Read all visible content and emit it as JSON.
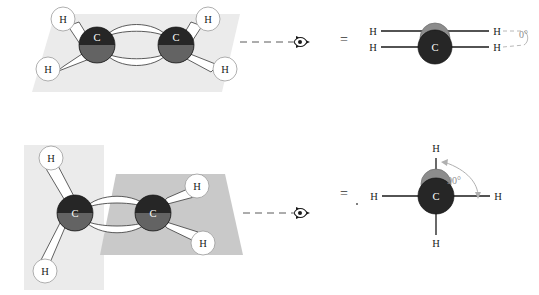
{
  "figure": {
    "colors": {
      "plane_light": "#ebebeb",
      "plane_medium": "#e2e2e2",
      "plane_dark": "#bfbfbf",
      "carbon_dark": "#262626",
      "carbon_shadow": "#6e6e6e",
      "back_atom_gray": "#8c8c8c",
      "hydrogen_fill": "#ffffff",
      "hydrogen_stroke": "#9a9a9a",
      "bond_fill": "#ffffff",
      "bond_stroke": "#3a3a3a",
      "dash_gray": "#9a9a9a",
      "angle_text": "#8d8d8d",
      "text": "#1a1a1a"
    },
    "rows": [
      {
        "id": "row-planar",
        "dihedral_angle": "0°",
        "model_label": "planar ethene, both CH2 groups in one plane",
        "plane_count": 1,
        "atoms": {
          "carbon_left": "C",
          "carbon_right": "C",
          "hydrogens": [
            "H",
            "H",
            "H",
            "H"
          ]
        },
        "newman": {
          "front_carbon": "C",
          "hydrogens_back": [
            "H",
            "H"
          ],
          "hydrogens_front": [
            "H",
            "H"
          ],
          "angle": "0°",
          "conformation": "eclipsed"
        },
        "equals_sign": "=",
        "viewer_icon": "eye-icon",
        "sight_line": "dashed"
      },
      {
        "id": "row-perpendicular",
        "dihedral_angle": "90°",
        "model_label": "twisted ethene, CH2 groups in perpendicular planes",
        "plane_count": 2,
        "atoms": {
          "carbon_left": "C",
          "carbon_right": "C",
          "hydrogens": [
            "H",
            "H",
            "H",
            "H"
          ]
        },
        "newman": {
          "front_carbon": "C",
          "hydrogens_back": [
            "H",
            "H"
          ],
          "hydrogens_front": [
            "H",
            "H"
          ],
          "angle": "90°",
          "conformation": "staggered-perpendicular"
        },
        "equals_sign": "=",
        "viewer_icon": "eye-icon",
        "sight_line": "dashed"
      }
    ]
  }
}
